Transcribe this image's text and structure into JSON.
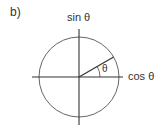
{
  "figure": {
    "panel_label": "b)",
    "y_axis_label": "sin θ",
    "x_axis_label": "cos θ",
    "angle_label": "θ"
  },
  "geometry": {
    "center": [
      79,
      77
    ],
    "radius": 40,
    "angle_deg": 30
  },
  "colors": {
    "stroke": "#333333",
    "circle": "#555555"
  }
}
